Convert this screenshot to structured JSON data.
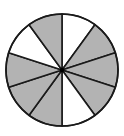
{
  "figure": {
    "total_parts": 10,
    "shaded_parts": 7,
    "center": [
      62,
      70
    ],
    "radius": 56,
    "start_angle_deg": -90,
    "direction": "clockwise",
    "sectors_shaded": [
      false,
      true,
      true,
      true,
      false,
      true,
      true,
      true,
      false,
      true
    ],
    "colors": {
      "shaded": "#b3b3b3",
      "unshaded": "#ffffff",
      "stroke": "#1a1a1a",
      "center_dot": "#000000"
    },
    "stroke_width": 1.6,
    "center_dot_radius": 2.2
  }
}
